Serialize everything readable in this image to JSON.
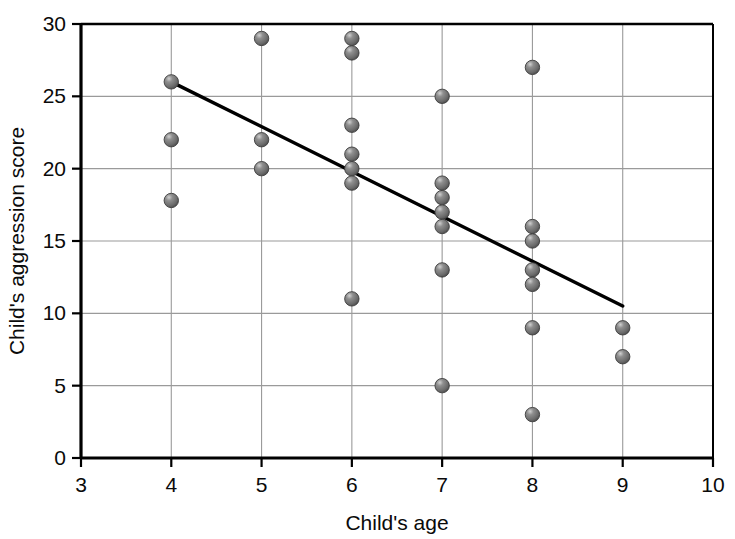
{
  "chart_data": {
    "type": "scatter",
    "title": "",
    "xlabel": "Child's age",
    "ylabel": "Child's aggression score",
    "xlim": [
      3,
      10
    ],
    "ylim": [
      0,
      30
    ],
    "xticks": [
      3,
      4,
      5,
      6,
      7,
      8,
      9,
      10
    ],
    "yticks": [
      0,
      5,
      10,
      15,
      20,
      25,
      30
    ],
    "grid": true,
    "legend": "none",
    "marker_color": "#6e6e6e",
    "marker_edge_color": "#3c3c3c",
    "trendline_color": "#000000",
    "axis_color": "#000000",
    "grid_color": "#9a9a9a",
    "points": [
      {
        "x": 4,
        "y": 26
      },
      {
        "x": 4,
        "y": 22
      },
      {
        "x": 4,
        "y": 17.8
      },
      {
        "x": 5,
        "y": 29
      },
      {
        "x": 5,
        "y": 22
      },
      {
        "x": 5,
        "y": 20
      },
      {
        "x": 6,
        "y": 29
      },
      {
        "x": 6,
        "y": 28
      },
      {
        "x": 6,
        "y": 23
      },
      {
        "x": 6,
        "y": 21
      },
      {
        "x": 6,
        "y": 20
      },
      {
        "x": 6,
        "y": 19
      },
      {
        "x": 6,
        "y": 11
      },
      {
        "x": 7,
        "y": 25
      },
      {
        "x": 7,
        "y": 19
      },
      {
        "x": 7,
        "y": 18
      },
      {
        "x": 7,
        "y": 17
      },
      {
        "x": 7,
        "y": 16
      },
      {
        "x": 7,
        "y": 13
      },
      {
        "x": 7,
        "y": 5
      },
      {
        "x": 8,
        "y": 27
      },
      {
        "x": 8,
        "y": 16
      },
      {
        "x": 8,
        "y": 15
      },
      {
        "x": 8,
        "y": 13
      },
      {
        "x": 8,
        "y": 12
      },
      {
        "x": 8,
        "y": 9
      },
      {
        "x": 8,
        "y": 3
      },
      {
        "x": 9,
        "y": 9
      },
      {
        "x": 9,
        "y": 7
      }
    ],
    "trendline": {
      "x_start": 4,
      "y_start": 26,
      "x_end": 9,
      "y_end": 10.5
    }
  }
}
